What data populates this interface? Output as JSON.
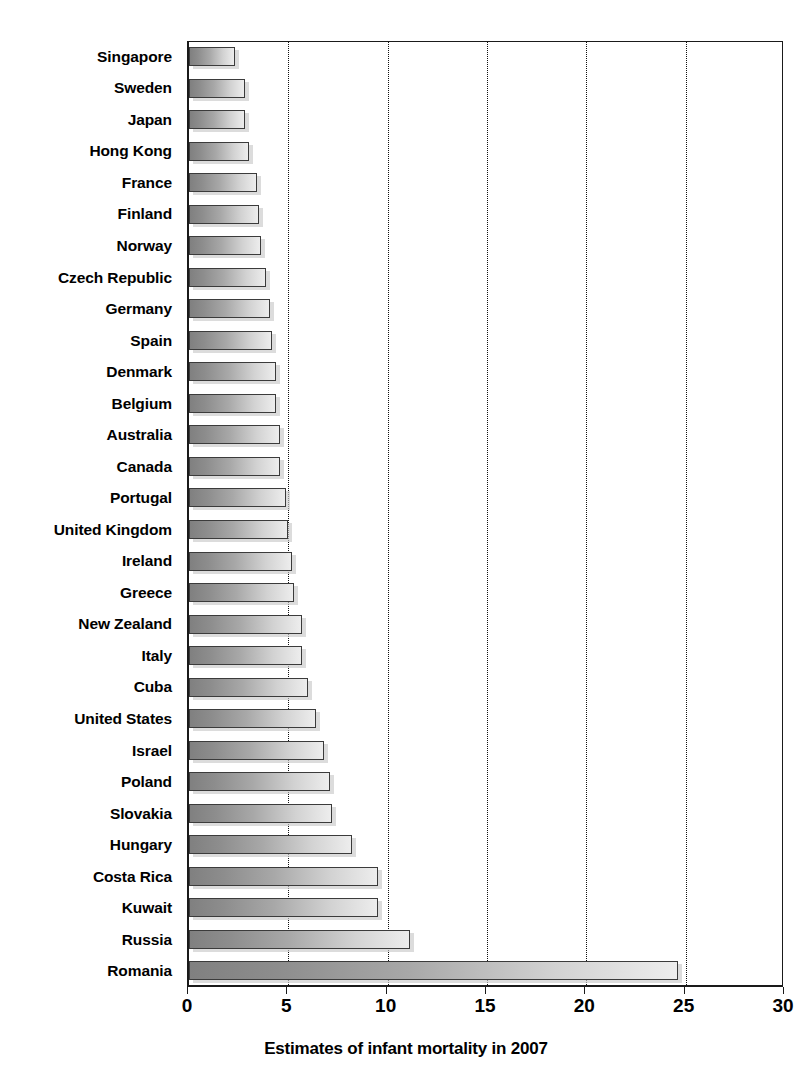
{
  "chart_data": {
    "type": "bar",
    "orientation": "horizontal",
    "title": "",
    "xlabel": "Estimates of infant mortality in 2007",
    "ylabel": "",
    "xlim": [
      0,
      30
    ],
    "xticks": [
      0,
      5,
      10,
      15,
      20,
      25,
      30
    ],
    "xtick_labels": [
      "0",
      "5",
      "10",
      "15",
      "20",
      "25",
      "30"
    ],
    "grid": "vertical dotted gridlines at each x tick",
    "legend": "none",
    "categories": [
      "Singapore",
      "Sweden",
      "Japan",
      "Hong Kong",
      "France",
      "Finland",
      "Norway",
      "Czech Republic",
      "Germany",
      "Spain",
      "Denmark",
      "Belgium",
      "Australia",
      "Canada",
      "Portugal",
      "United Kingdom",
      "Ireland",
      "Greece",
      "New Zealand",
      "Italy",
      "Cuba",
      "United States",
      "Israel",
      "Poland",
      "Slovakia",
      "Hungary",
      "Costa Rica",
      "Kuwait",
      "Russia",
      "Romania"
    ],
    "values": [
      2.3,
      2.8,
      2.8,
      3.0,
      3.4,
      3.5,
      3.6,
      3.9,
      4.1,
      4.2,
      4.4,
      4.4,
      4.6,
      4.6,
      4.9,
      5.0,
      5.2,
      5.3,
      5.7,
      5.7,
      6.0,
      6.4,
      6.8,
      7.1,
      7.2,
      8.2,
      9.5,
      9.5,
      11.1,
      24.6
    ]
  },
  "axis": {
    "x_title": "Estimates of infant mortality in 2007"
  },
  "style": {
    "bar_fill_dark": "#808080",
    "bar_fill_light": "#ededed",
    "bar_border": "#3b3b3b",
    "axis_color": "#1a1a1a",
    "gridline_color": "#111111",
    "background": "#ffffff",
    "text_color": "#000000"
  }
}
